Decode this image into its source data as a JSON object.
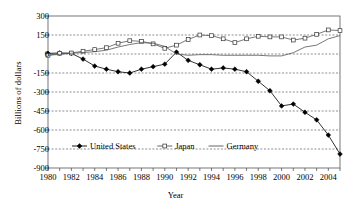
{
  "chart_data": {
    "type": "line",
    "title": "",
    "xlabel": "Year",
    "ylabel": "Billions of dollars",
    "xlim": [
      1980,
      2005
    ],
    "ylim": [
      -900,
      300
    ],
    "grid": true,
    "grid_axis": "y",
    "legend_position": "inside-bottom-left",
    "x": [
      1980,
      1981,
      1982,
      1983,
      1984,
      1985,
      1986,
      1987,
      1988,
      1989,
      1990,
      1991,
      1992,
      1993,
      1994,
      1995,
      1996,
      1997,
      1998,
      1999,
      2000,
      2001,
      2002,
      2003,
      2004,
      2005
    ],
    "x_tick_labels": [
      "1980",
      "1982",
      "1984",
      "1986",
      "1988",
      "1990",
      "1992",
      "1994",
      "1996",
      "1998",
      "2000",
      "2002",
      "2004"
    ],
    "x_tick_values": [
      1980,
      1982,
      1984,
      1986,
      1988,
      1990,
      1992,
      1994,
      1996,
      1998,
      2000,
      2002,
      2004
    ],
    "y_tick_labels": [
      "300",
      "150",
      "0",
      "-150",
      "-300",
      "-450",
      "-600",
      "-750",
      "-900"
    ],
    "y_tick_values": [
      300,
      150,
      0,
      -150,
      -300,
      -450,
      -600,
      -750,
      -900
    ],
    "series": [
      {
        "name": "United States",
        "marker": "filled-diamond",
        "color": "#000000",
        "values": [
          5,
          8,
          5,
          -40,
          -95,
          -120,
          -140,
          -150,
          -120,
          -100,
          -80,
          15,
          -50,
          -85,
          -120,
          -110,
          -120,
          -140,
          -215,
          -290,
          -410,
          -395,
          -460,
          -520,
          -640,
          -790
        ]
      },
      {
        "name": "Japan",
        "marker": "open-square",
        "color": "#555555",
        "values": [
          -10,
          5,
          8,
          22,
          35,
          50,
          85,
          105,
          100,
          80,
          45,
          70,
          115,
          150,
          145,
          120,
          90,
          120,
          140,
          135,
          135,
          110,
          125,
          155,
          190,
          185
        ]
      },
      {
        "name": "Germany",
        "marker": "none",
        "color": "#555555",
        "values": [
          -10,
          -3,
          6,
          12,
          18,
          30,
          55,
          75,
          90,
          85,
          60,
          0,
          -10,
          -5,
          -5,
          -10,
          -10,
          -10,
          -10,
          -15,
          -15,
          10,
          55,
          70,
          120,
          145
        ]
      }
    ]
  },
  "legend": {
    "items": [
      {
        "label": "United States",
        "marker": "filled-diamond"
      },
      {
        "label": "Japan",
        "marker": "open-square"
      },
      {
        "label": "Germany",
        "marker": "none"
      }
    ]
  },
  "axes": {
    "y_title": "Billions of dollars",
    "x_title": "Year"
  }
}
